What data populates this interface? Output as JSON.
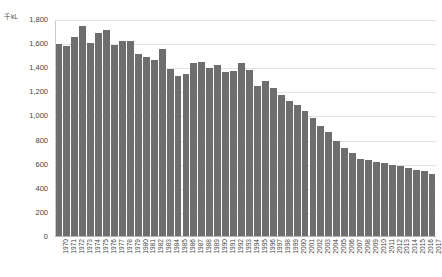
{
  "chart_data": {
    "type": "bar",
    "title": "",
    "subtitle": "",
    "xlabel": "",
    "ylabel": "",
    "unit_label": "千kL",
    "ylim": [
      0,
      1800
    ],
    "grid": true,
    "legend": false,
    "bar_color": "#6e6e6e",
    "gridline_color": "#e3e3e3",
    "y_ticks": [
      "0",
      "200",
      "400",
      "600",
      "800",
      "1,000",
      "1,200",
      "1,400",
      "1,600",
      "1,800"
    ],
    "y_tick_values": [
      0,
      200,
      400,
      600,
      800,
      1000,
      1200,
      1400,
      1600,
      1800
    ],
    "categories": [
      "1970",
      "1971",
      "1972",
      "1973",
      "1974",
      "1975",
      "1976",
      "1977",
      "1978",
      "1979",
      "1980",
      "1981",
      "1982",
      "1983",
      "1984",
      "1985",
      "1986",
      "1987",
      "1988",
      "1989",
      "1990",
      "1991",
      "1992",
      "1993",
      "1994",
      "1995",
      "1996",
      "1997",
      "1998",
      "1999",
      "2000",
      "2001",
      "2002",
      "2003",
      "2004",
      "2005",
      "2006",
      "2007",
      "2008",
      "2009",
      "2010",
      "2011",
      "2012",
      "2013",
      "2014",
      "2015",
      "2016",
      "2017"
    ],
    "values": [
      1600,
      1585,
      1660,
      1750,
      1610,
      1690,
      1720,
      1590,
      1625,
      1630,
      1520,
      1490,
      1465,
      1560,
      1390,
      1335,
      1350,
      1440,
      1455,
      1400,
      1430,
      1370,
      1375,
      1445,
      1385,
      1250,
      1290,
      1240,
      1180,
      1130,
      1095,
      1045,
      985,
      920,
      870,
      800,
      740,
      700,
      650,
      640,
      620,
      610,
      600,
      590,
      575,
      560,
      545,
      520
    ]
  }
}
